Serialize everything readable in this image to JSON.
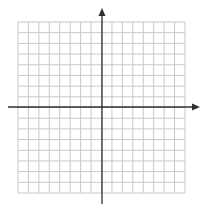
{
  "diagram": {
    "type": "coordinate-plane",
    "grid": {
      "columns": 16,
      "rows": 16,
      "left": 18,
      "top": 22,
      "right": 185,
      "bottom": 193,
      "line_color": "#c8c8c8"
    },
    "x_axis": {
      "y": 107,
      "start": 8,
      "end": 200,
      "arrow_right": true,
      "arrow_left": false,
      "color": "#2f2f2f"
    },
    "y_axis": {
      "x": 102,
      "start": 8,
      "end": 204,
      "arrow_top": true,
      "arrow_bottom": false,
      "color": "#2f2f2f"
    },
    "background": "#ffffff"
  }
}
